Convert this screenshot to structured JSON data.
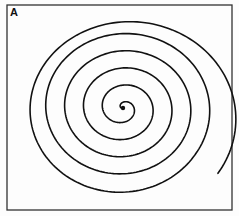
{
  "figure": {
    "panel_label": "A",
    "frame": {
      "x": 7,
      "y": 5,
      "width": 225,
      "height": 205,
      "stroke": "#333333"
    },
    "spiral": {
      "center": [
        123,
        108
      ],
      "turns": 5.6,
      "start_radius": 1.5,
      "growth_per_turn": 17.5,
      "outer_bulge": {
        "dx": 8,
        "dy": 8
      },
      "stroke": "#111111",
      "stroke_width": 1.6,
      "center_dot_radius": 2.2
    }
  }
}
